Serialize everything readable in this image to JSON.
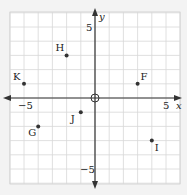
{
  "title": "",
  "grid": {
    "xmin": -6,
    "xmax": 6,
    "ymin": -6,
    "ymax": 6,
    "step": 1
  },
  "axes": {
    "x_label": "x",
    "y_label": "y",
    "x_ticks": [
      {
        "value": -5,
        "label": "−5"
      },
      {
        "value": 5,
        "label": "5"
      }
    ],
    "y_ticks": [
      {
        "value": 5,
        "label": "5"
      },
      {
        "value": -5,
        "label": "−5"
      }
    ]
  },
  "points": [
    {
      "label": "H",
      "x": -2,
      "y": 3,
      "lpos": "tl"
    },
    {
      "label": "K",
      "x": -5,
      "y": 1,
      "lpos": "tl"
    },
    {
      "label": "F",
      "x": 3,
      "y": 1,
      "lpos": "tr"
    },
    {
      "label": "J",
      "x": -1,
      "y": -1,
      "lpos": "bl"
    },
    {
      "label": "G",
      "x": -4,
      "y": -2,
      "lpos": "bl"
    },
    {
      "label": "I",
      "x": 4,
      "y": -3,
      "lpos": "br"
    }
  ],
  "colors": {
    "grid": "#d8d8d8",
    "axis": "#333333",
    "background": "#ffffff",
    "frame": "#bbbbbb"
  }
}
